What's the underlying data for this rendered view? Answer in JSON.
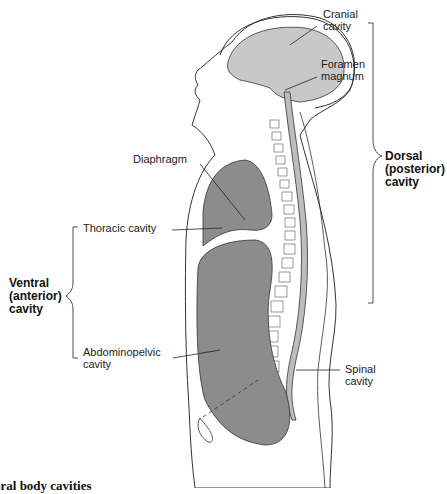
{
  "figure": {
    "caption": "oral body cavities",
    "colors": {
      "cranial_fill": "#c8c8c8",
      "organ_fill": "#8c8c8c",
      "spinal_fill": "#bdbdbd",
      "outline": "#333333",
      "background": "#ffffff"
    }
  },
  "labels": {
    "cranial": [
      "Cranial",
      "cavity"
    ],
    "foramen": [
      "Foramen",
      "magnum"
    ],
    "diaphragm": "Diaphragm",
    "thoracic": "Thoracic cavity",
    "abdominopelvic": [
      "Abdominopelvic",
      "cavity"
    ],
    "spinal": [
      "Spinal",
      "cavity"
    ]
  },
  "groups": {
    "dorsal": [
      "Dorsal",
      "(posterior)",
      "cavity"
    ],
    "ventral": [
      "Ventral",
      "(anterior)",
      "cavity"
    ]
  }
}
